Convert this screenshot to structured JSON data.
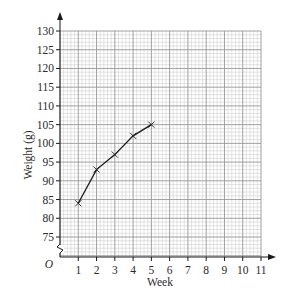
{
  "chart_data": {
    "type": "line",
    "title": "",
    "xlabel": "Week",
    "ylabel": "Weight (g)",
    "origin_label": "O",
    "x": [
      1,
      2,
      3,
      4,
      5
    ],
    "series": [
      {
        "name": "Weight",
        "values": [
          84,
          93,
          97,
          102,
          105
        ],
        "marker": "x",
        "color": "#1a1a1a"
      }
    ],
    "xlim": [
      0,
      11
    ],
    "ylim": [
      75,
      130
    ],
    "y_axis_break": true,
    "x_ticks": [
      1,
      2,
      3,
      4,
      5,
      6,
      7,
      8,
      9,
      10,
      11
    ],
    "x_tick_labels": [
      "1",
      "2",
      "3",
      "4",
      "5",
      "6",
      "7",
      "8",
      "9",
      "10",
      "11"
    ],
    "y_ticks": [
      75,
      80,
      85,
      90,
      95,
      100,
      105,
      110,
      115,
      120,
      125,
      130
    ],
    "y_tick_labels": [
      "75",
      "80",
      "85",
      "90",
      "95",
      "100",
      "105",
      "110",
      "115",
      "120",
      "125",
      "130"
    ],
    "grid": true,
    "minor_grid_per_major_x": 5,
    "minor_grid_per_major_y": 5,
    "colors": {
      "axis": "#1a1a1a",
      "major_grid": "#8c8c8c",
      "minor_grid": "#c8c8c8"
    }
  }
}
